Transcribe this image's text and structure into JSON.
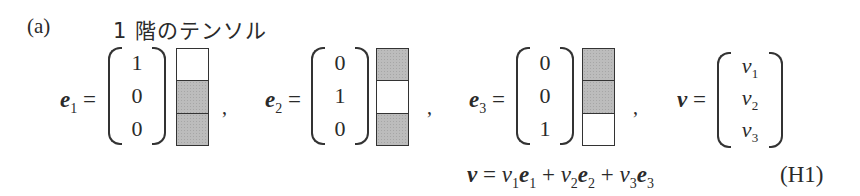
{
  "figure": {
    "panel_label": "(a)",
    "heading": "1 階のテンソル",
    "equation_number": "(H1)"
  },
  "vectors": [
    {
      "name": "e",
      "subscript": "1",
      "entries": [
        "1",
        "0",
        "0"
      ],
      "cells_shaded": [
        false,
        true,
        true
      ]
    },
    {
      "name": "e",
      "subscript": "2",
      "entries": [
        "0",
        "1",
        "0"
      ],
      "cells_shaded": [
        true,
        false,
        true
      ]
    },
    {
      "name": "e",
      "subscript": "3",
      "entries": [
        "0",
        "0",
        "1"
      ],
      "cells_shaded": [
        true,
        true,
        false
      ]
    }
  ],
  "general_vector": {
    "name": "v",
    "entries": [
      {
        "base": "v",
        "sub": "1"
      },
      {
        "base": "v",
        "sub": "2"
      },
      {
        "base": "v",
        "sub": "3"
      }
    ]
  },
  "symbols": {
    "equals": "=",
    "comma": ",",
    "plus": "+"
  },
  "colors": {
    "shaded_cell": "#bcbcbc",
    "ink": "#2a2a2a"
  }
}
